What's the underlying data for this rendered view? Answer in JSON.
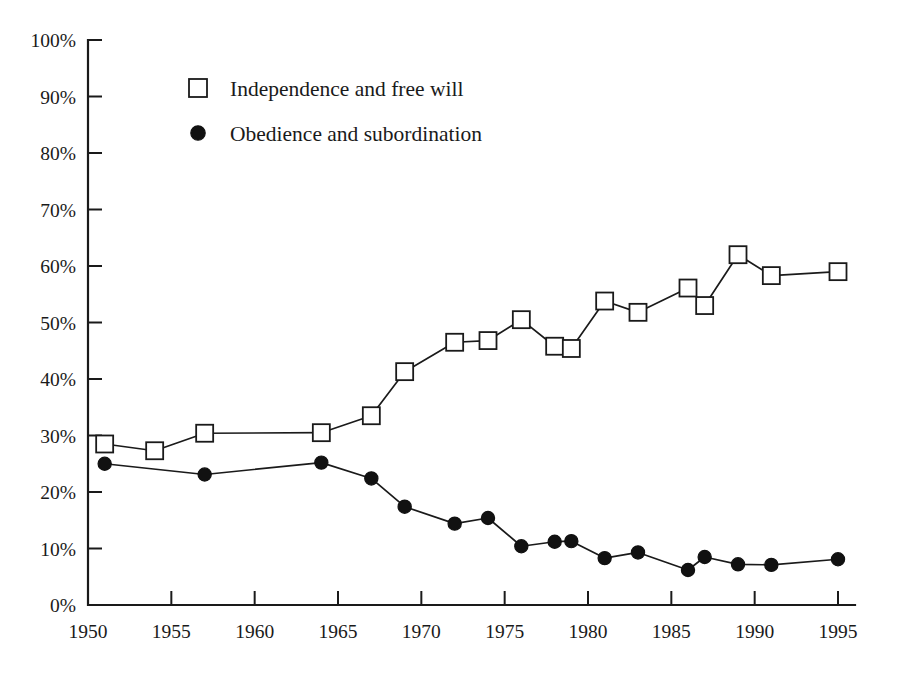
{
  "chart_data": {
    "type": "line",
    "title": "",
    "subtitle": "",
    "xlabel": "",
    "ylabel": "",
    "xlim": [
      1950,
      1996
    ],
    "ylim": [
      0,
      100
    ],
    "grid": false,
    "legend_position": "top-left",
    "x_tick_labels": [
      "1950",
      "1955",
      "1960",
      "1965",
      "1970",
      "1975",
      "1980",
      "1985",
      "1990",
      "1995"
    ],
    "x_ticks": [
      1950,
      1955,
      1960,
      1965,
      1970,
      1975,
      1980,
      1985,
      1990,
      1995
    ],
    "y_tick_labels": [
      "0%",
      "10%",
      "20%",
      "30%",
      "40%",
      "50%",
      "60%",
      "70%",
      "80%",
      "90%",
      "100%"
    ],
    "y_ticks": [
      0,
      10,
      20,
      30,
      40,
      50,
      60,
      70,
      80,
      90,
      100
    ],
    "series": [
      {
        "name": "Independence and free will",
        "marker": "open-square",
        "color": "#1a1a1a",
        "points": [
          {
            "x": 1951,
            "y": 28.5
          },
          {
            "x": 1954,
            "y": 27.3
          },
          {
            "x": 1957,
            "y": 30.4
          },
          {
            "x": 1964,
            "y": 30.5
          },
          {
            "x": 1967,
            "y": 33.5
          },
          {
            "x": 1969,
            "y": 41.3
          },
          {
            "x": 1972,
            "y": 46.5
          },
          {
            "x": 1974,
            "y": 46.8
          },
          {
            "x": 1976,
            "y": 50.5
          },
          {
            "x": 1978,
            "y": 45.8
          },
          {
            "x": 1979,
            "y": 45.4
          },
          {
            "x": 1981,
            "y": 53.8
          },
          {
            "x": 1983,
            "y": 51.8
          },
          {
            "x": 1986,
            "y": 56.1
          },
          {
            "x": 1987,
            "y": 53.0
          },
          {
            "x": 1989,
            "y": 62.0
          },
          {
            "x": 1991,
            "y": 58.3
          },
          {
            "x": 1995,
            "y": 59.0
          }
        ]
      },
      {
        "name": "Obedience and subordination",
        "marker": "filled-circle",
        "color": "#111111",
        "points": [
          {
            "x": 1951,
            "y": 25.0
          },
          {
            "x": 1957,
            "y": 23.1
          },
          {
            "x": 1964,
            "y": 25.2
          },
          {
            "x": 1967,
            "y": 22.4
          },
          {
            "x": 1969,
            "y": 17.4
          },
          {
            "x": 1972,
            "y": 14.4
          },
          {
            "x": 1974,
            "y": 15.4
          },
          {
            "x": 1976,
            "y": 10.4
          },
          {
            "x": 1978,
            "y": 11.2
          },
          {
            "x": 1979,
            "y": 11.3
          },
          {
            "x": 1981,
            "y": 8.3
          },
          {
            "x": 1983,
            "y": 9.3
          },
          {
            "x": 1986,
            "y": 6.2
          },
          {
            "x": 1987,
            "y": 8.5
          },
          {
            "x": 1989,
            "y": 7.2
          },
          {
            "x": 1991,
            "y": 7.1
          },
          {
            "x": 1995,
            "y": 8.1
          }
        ]
      }
    ]
  },
  "legend": {
    "entries": [
      {
        "label": "Independence and free will",
        "marker": "open-square"
      },
      {
        "label": "Obedience and subordination",
        "marker": "filled-circle"
      }
    ]
  }
}
